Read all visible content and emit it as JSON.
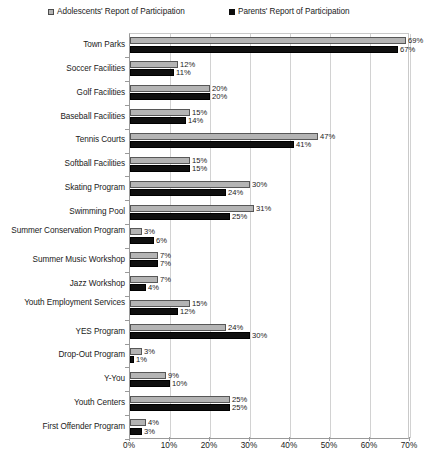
{
  "legend": {
    "position": "top",
    "entries": [
      {
        "label": "Adolescents' Report of Participation",
        "marker": "gray-square-icon",
        "color": "#b4b4b4"
      },
      {
        "label": "Parents' Report of Participation",
        "marker": "black-square-icon",
        "color": "#0f0f0f"
      }
    ]
  },
  "chart_data": {
    "type": "bar",
    "orientation": "horizontal",
    "title": "",
    "xlabel": "",
    "ylabel": "",
    "xlim": [
      0,
      70
    ],
    "grid": true,
    "legend_position": "top",
    "tick_labels": [
      "0%",
      "10%",
      "20%",
      "30%",
      "40%",
      "50%",
      "60%",
      "70%"
    ],
    "tick_values": [
      0,
      10,
      20,
      30,
      40,
      50,
      60,
      70
    ],
    "value_suffix": "%",
    "categories": [
      "Town Parks",
      "Soccer Facilities",
      "Golf Facilities",
      "Baseball Facilities",
      "Tennis Courts",
      "Softball Facilities",
      "Skating Program",
      "Swimming Pool",
      "Summer Conservation Program",
      "Summer Music Workshop",
      "Jazz Workshop",
      "Youth Employment Services",
      "YES Program",
      "Drop-Out Program",
      "Y-You",
      "Youth Centers",
      "First Offender Program"
    ],
    "series": [
      {
        "name": "Adolescents' Report of Participation",
        "color": "#b4b4b4",
        "values": [
          69,
          12,
          20,
          15,
          47,
          15,
          30,
          31,
          3,
          7,
          7,
          15,
          24,
          3,
          9,
          25,
          4
        ],
        "labels": [
          "69%",
          "12%",
          "20%",
          "15%",
          "47%",
          "15%",
          "30%",
          "31%",
          "3%",
          "7%",
          "7%",
          "15%",
          "24%",
          "3%",
          "9%",
          "25%",
          "4%"
        ]
      },
      {
        "name": "Parents' Report of Participation",
        "color": "#0f0f0f",
        "values": [
          67,
          11,
          20,
          14,
          41,
          15,
          24,
          25,
          6,
          7,
          4,
          12,
          30,
          1,
          10,
          25,
          3
        ],
        "labels": [
          "67%",
          "11%",
          "20%",
          "14%",
          "41%",
          "15%",
          "24%",
          "25%",
          "6%",
          "7%",
          "4%",
          "12%",
          "30%",
          "1%",
          "10%",
          "25%",
          "3%"
        ]
      }
    ]
  }
}
